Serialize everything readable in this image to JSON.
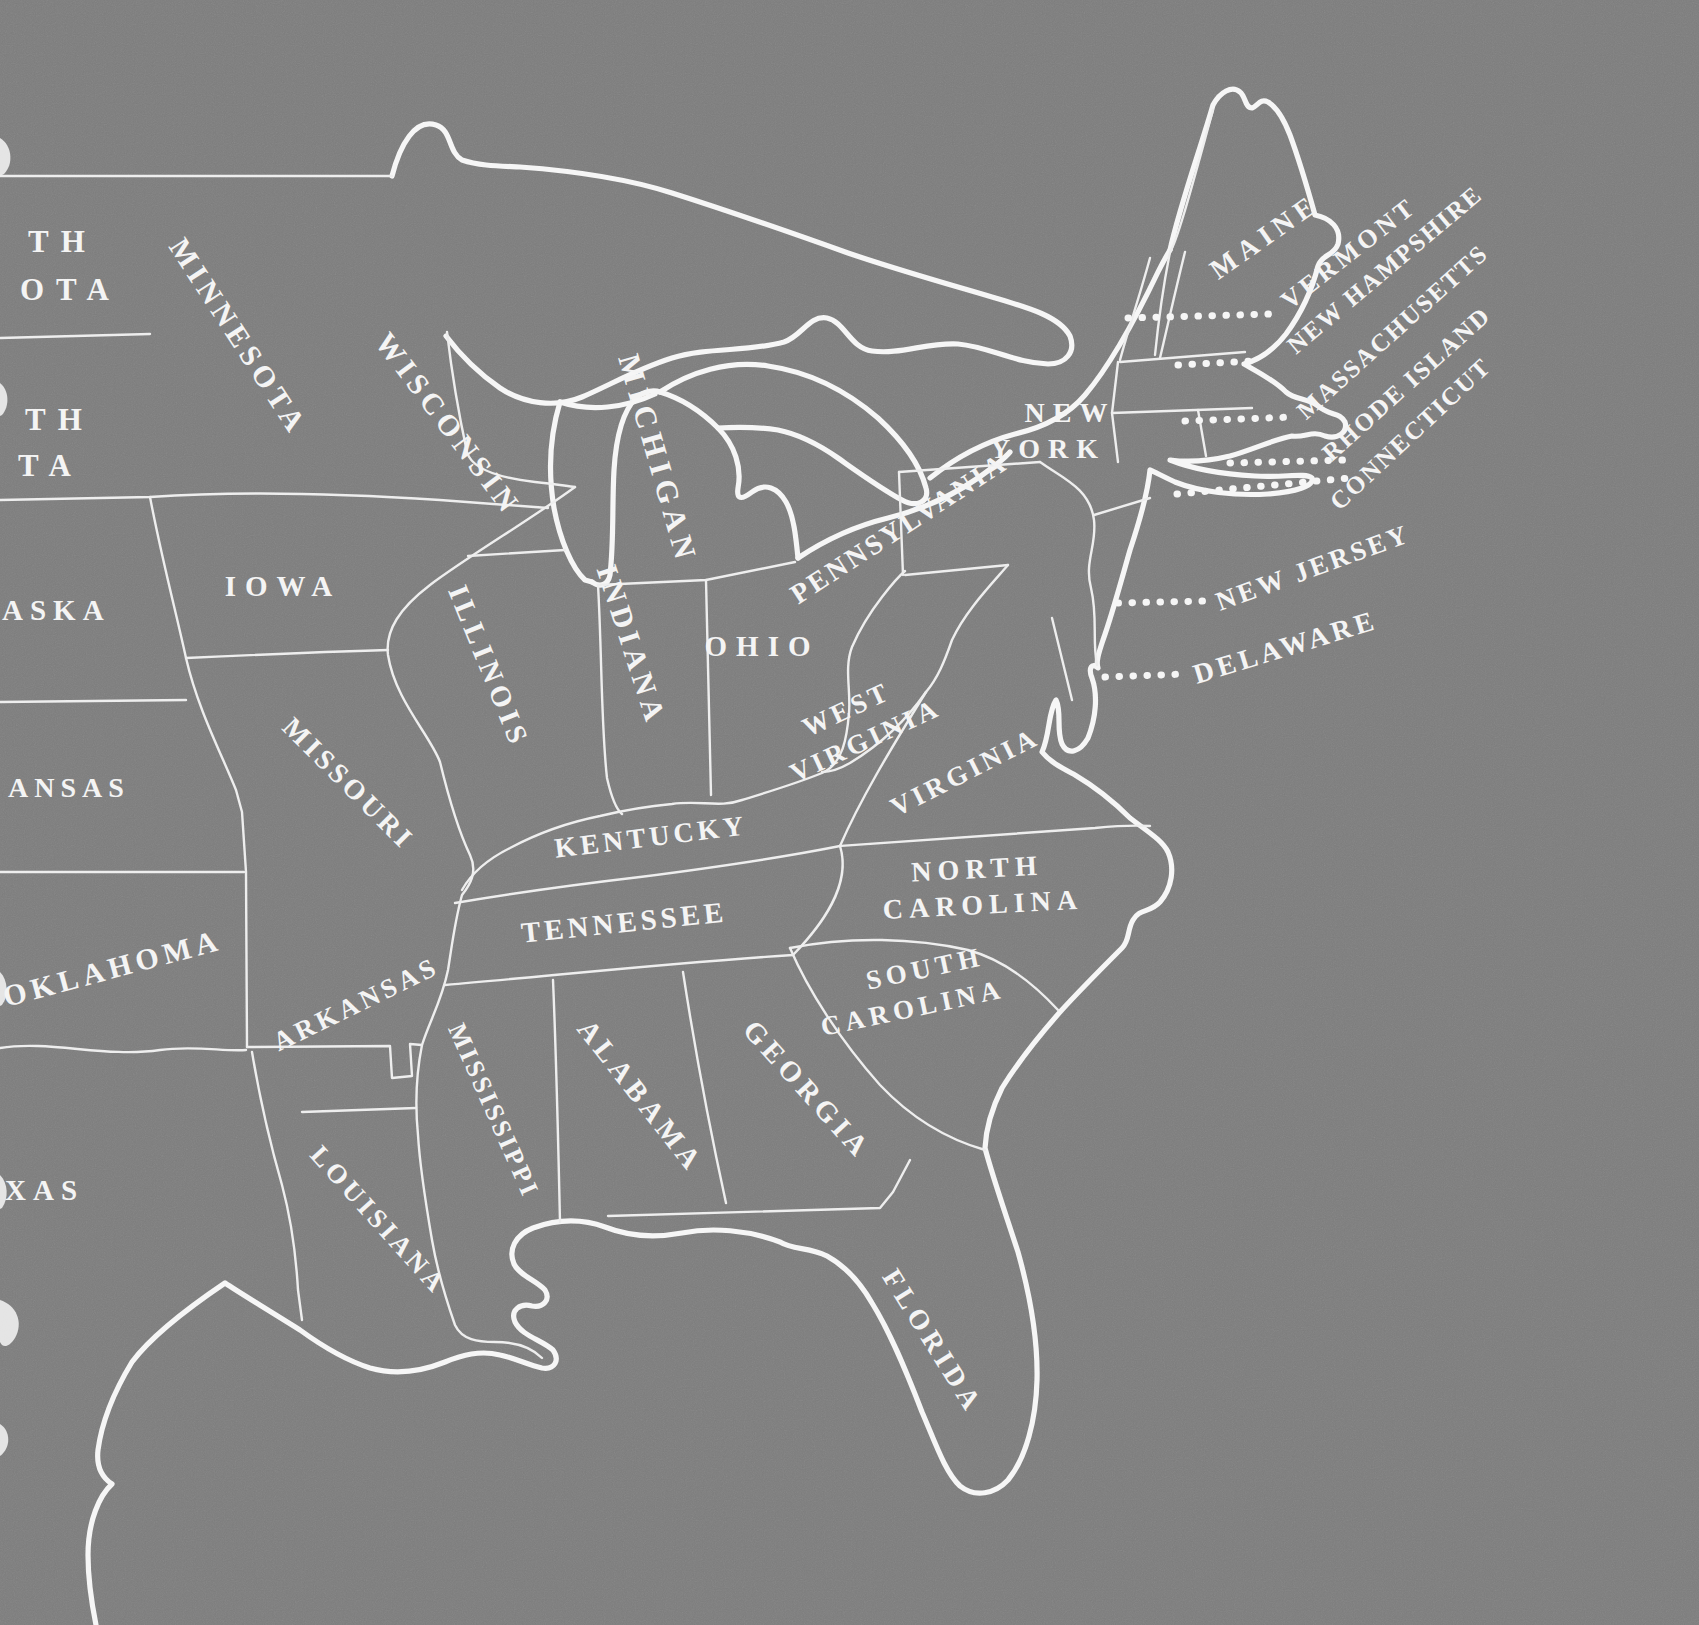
{
  "map": {
    "region_depicted": "Eastern and Central United States",
    "style": "hand-drawn white outline map with serif state labels on a gray paper background",
    "background_color": "#7d7d7d",
    "line_color": "#f4f4f4",
    "callout_states_with_dotted_leaders": [
      "VERMONT",
      "NEW HAMPSHIRE",
      "MASSACHUSETTS",
      "RHODE ISLAND",
      "CONNECTICUT",
      "NEW JERSEY",
      "DELAWARE"
    ]
  },
  "labels": {
    "north_dakota": {
      "lines": [
        "TH",
        "OTA"
      ]
    },
    "south_dakota": {
      "lines": [
        "TH",
        "TA"
      ]
    },
    "nebraska": {
      "lines": [
        "ASKA"
      ]
    },
    "kansas": {
      "lines": [
        "ANSAS"
      ]
    },
    "oklahoma": {
      "lines": [
        "OKLAHOMA"
      ]
    },
    "texas": {
      "lines": [
        "XAS"
      ]
    },
    "minnesota": {
      "lines": [
        "MINNESOTA"
      ]
    },
    "iowa": {
      "lines": [
        "IOWA"
      ]
    },
    "missouri": {
      "lines": [
        "MISSOURI"
      ]
    },
    "arkansas": {
      "lines": [
        "ARKANSAS"
      ]
    },
    "louisiana": {
      "lines": [
        "LOUISIANA"
      ]
    },
    "wisconsin": {
      "lines": [
        "WISCONSIN"
      ]
    },
    "michigan": {
      "lines": [
        "MICHIGAN"
      ]
    },
    "illinois": {
      "lines": [
        "ILLINOIS"
      ]
    },
    "indiana": {
      "lines": [
        "INDIANA"
      ]
    },
    "ohio": {
      "lines": [
        "OHIO"
      ]
    },
    "kentucky": {
      "lines": [
        "KENTUCKY"
      ]
    },
    "tennessee": {
      "lines": [
        "TENNESSEE"
      ]
    },
    "mississippi": {
      "lines": [
        "MISSISSIPPI"
      ]
    },
    "alabama": {
      "lines": [
        "ALABAMA"
      ]
    },
    "georgia": {
      "lines": [
        "GEORGIA"
      ]
    },
    "florida": {
      "lines": [
        "FLORIDA"
      ]
    },
    "west_virginia": {
      "lines": [
        "WEST",
        "VIRGINIA"
      ]
    },
    "virginia": {
      "lines": [
        "VIRGINIA"
      ]
    },
    "north_carolina": {
      "lines": [
        "NORTH",
        "CAROLINA"
      ]
    },
    "south_carolina": {
      "lines": [
        "SOUTH",
        "CAROLINA"
      ]
    },
    "new_york": {
      "lines": [
        "NEW",
        "YORK"
      ]
    },
    "pennsylvania": {
      "lines": [
        "PENNSYLVANIA"
      ]
    },
    "maine": {
      "lines": [
        "MAINE"
      ]
    },
    "vermont": {
      "lines": [
        "VERMONT"
      ]
    },
    "new_hampshire": {
      "lines": [
        "NEW HAMPSHIRE"
      ]
    },
    "massachusetts": {
      "lines": [
        "MASSACHUSETTS"
      ]
    },
    "rhode_island": {
      "lines": [
        "RHODE ISLAND"
      ]
    },
    "connecticut": {
      "lines": [
        "CONNECTICUT"
      ]
    },
    "new_jersey": {
      "lines": [
        "NEW JERSEY"
      ]
    },
    "delaware": {
      "lines": [
        "DELAWARE"
      ]
    }
  }
}
